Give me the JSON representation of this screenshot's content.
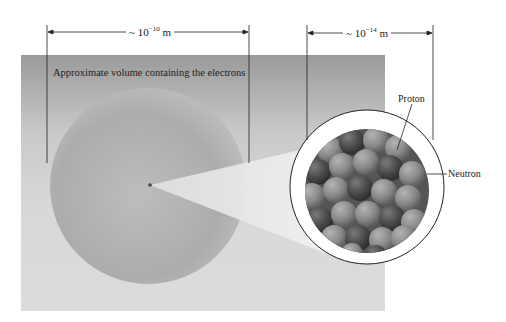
{
  "figure": {
    "caption_label": "Approximate volume containing the electrons",
    "atom_scale": {
      "prefix": "~ 10",
      "exponent": "−10",
      "unit": " m"
    },
    "nucleus_scale": {
      "prefix": "~ 10",
      "exponent": "−14",
      "unit": " m"
    },
    "labels": {
      "proton": "Proton",
      "neutron": "Neutron"
    },
    "colors": {
      "panel_top": "#9a9a9a",
      "panel_bottom": "#dcdcdc",
      "sphere": "#b0b0b0",
      "nucleon_dark": "#4a4a4a",
      "nucleon_light": "#8a8a8a",
      "line": "#222222"
    }
  }
}
